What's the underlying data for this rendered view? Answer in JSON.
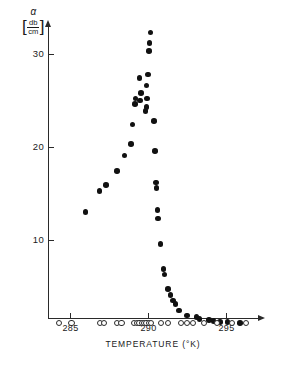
{
  "chart_data": {
    "type": "scatter",
    "title": "",
    "xlabel": "TEMPERATURE  (°K)",
    "ylabel": "α",
    "ylabel_unit_numerator": "db",
    "ylabel_unit_denominator": "cm",
    "ylabel_bracket_open": "[",
    "ylabel_bracket_close": "]",
    "xlim": [
      283.6,
      296.8
    ],
    "ylim": [
      0,
      33.5
    ],
    "xticks": [
      285,
      290,
      295
    ],
    "xtick_labels": [
      "285",
      "290",
      "295"
    ],
    "yticks": [
      10,
      20,
      30
    ],
    "ytick_labels": [
      "10",
      "20",
      "30"
    ],
    "grid": false,
    "legend": "none",
    "series": [
      {
        "name": "attenuation-filled",
        "marker": "filled-circle",
        "color": "#111111",
        "points": [
          [
            286.0,
            13.0
          ],
          [
            286.9,
            15.3
          ],
          [
            287.3,
            15.9
          ],
          [
            288.0,
            17.4
          ],
          [
            288.5,
            19.1
          ],
          [
            288.9,
            20.3
          ],
          [
            289.0,
            22.4
          ],
          [
            289.15,
            24.6
          ],
          [
            289.2,
            25.2
          ],
          [
            289.5,
            25.0
          ],
          [
            289.55,
            25.8
          ],
          [
            289.45,
            27.4
          ],
          [
            289.85,
            23.9
          ],
          [
            289.9,
            24.3
          ],
          [
            289.95,
            25.2
          ],
          [
            289.9,
            26.6
          ],
          [
            290.0,
            27.8
          ],
          [
            290.05,
            30.3
          ],
          [
            290.1,
            31.2
          ],
          [
            290.15,
            32.3
          ],
          [
            290.4,
            22.8
          ],
          [
            290.45,
            19.6
          ],
          [
            290.5,
            16.2
          ],
          [
            290.55,
            15.6
          ],
          [
            290.6,
            13.2
          ],
          [
            290.65,
            12.3
          ],
          [
            290.8,
            9.6
          ],
          [
            291.0,
            6.9
          ],
          [
            291.05,
            6.3
          ],
          [
            291.3,
            4.7
          ],
          [
            291.45,
            4.1
          ],
          [
            291.6,
            3.5
          ],
          [
            291.75,
            3.1
          ],
          [
            292.0,
            2.4
          ],
          [
            292.5,
            1.9
          ],
          [
            293.1,
            1.7
          ],
          [
            293.3,
            1.5
          ],
          [
            293.9,
            1.4
          ],
          [
            294.2,
            1.3
          ],
          [
            294.6,
            1.2
          ],
          [
            295.1,
            1.2
          ],
          [
            295.9,
            1.1
          ]
        ]
      },
      {
        "name": "baseline-open",
        "marker": "open-circle",
        "color": "#ffffff",
        "points": [
          [
            284.3,
            1.1
          ],
          [
            285.1,
            1.1
          ],
          [
            286.9,
            1.1
          ],
          [
            287.2,
            1.1
          ],
          [
            288.0,
            1.1
          ],
          [
            288.3,
            1.1
          ],
          [
            289.1,
            1.1
          ],
          [
            289.3,
            1.1
          ],
          [
            289.45,
            1.1
          ],
          [
            289.6,
            1.1
          ],
          [
            289.75,
            1.1
          ],
          [
            289.9,
            1.1
          ],
          [
            290.05,
            1.1
          ],
          [
            290.2,
            1.1
          ],
          [
            290.85,
            1.1
          ],
          [
            291.3,
            1.1
          ],
          [
            292.1,
            1.1
          ],
          [
            292.5,
            1.1
          ],
          [
            292.9,
            1.1
          ],
          [
            293.6,
            1.1
          ],
          [
            294.4,
            1.1
          ],
          [
            295.4,
            1.1
          ],
          [
            296.3,
            1.1
          ]
        ]
      }
    ]
  },
  "axes": {
    "y_axis_name": "alpha-attenuation-axis",
    "x_axis_name": "temperature-axis"
  }
}
